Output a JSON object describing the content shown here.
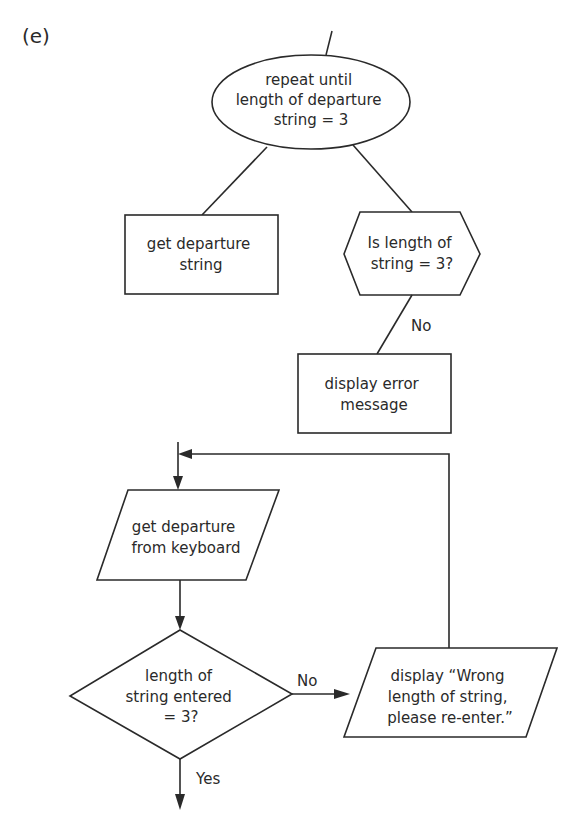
{
  "part_label": "(e)",
  "structure_diagram": {
    "loop": {
      "shape": "ellipse",
      "lines": [
        "repeat until",
        "length of departure",
        "string = 3"
      ]
    },
    "children": [
      {
        "shape": "rectangle",
        "lines": [
          "get departure",
          "string"
        ]
      },
      {
        "shape": "hexagon",
        "lines": [
          "Is length of",
          "string = 3?"
        ],
        "branch_label": "No",
        "child": {
          "shape": "rectangle",
          "lines": [
            "display error",
            "message"
          ]
        }
      }
    ]
  },
  "flowchart": {
    "input": {
      "shape": "parallelogram",
      "lines": [
        "get departure",
        "from keyboard"
      ]
    },
    "decision": {
      "shape": "diamond",
      "lines": [
        "length of",
        "string entered",
        "= 3?"
      ],
      "no_label": "No",
      "yes_label": "Yes"
    },
    "output": {
      "shape": "parallelogram",
      "lines": [
        "display “Wrong",
        "length of string,",
        "please re-enter.”"
      ]
    }
  }
}
